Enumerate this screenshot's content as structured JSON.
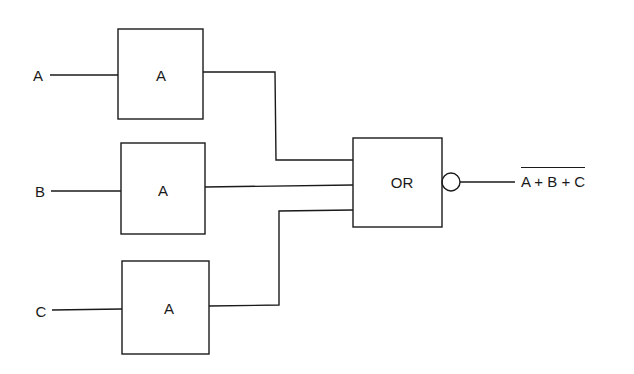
{
  "diagram": {
    "type": "logic-circuit",
    "inputs": [
      {
        "id": "in-a",
        "label": "A"
      },
      {
        "id": "in-b",
        "label": "B"
      },
      {
        "id": "in-c",
        "label": "C"
      }
    ],
    "gates": [
      {
        "id": "gate-1",
        "label": "A",
        "input": "A"
      },
      {
        "id": "gate-2",
        "label": "A",
        "input": "B"
      },
      {
        "id": "gate-3",
        "label": "A",
        "input": "C"
      },
      {
        "id": "gate-or",
        "label": "OR",
        "inverted_output": true
      }
    ],
    "output": {
      "label": "A + B + C",
      "overline": true
    }
  }
}
